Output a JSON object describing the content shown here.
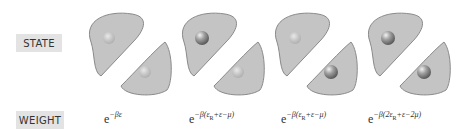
{
  "labels": {
    "state": "STATE",
    "weight": "WEIGHT"
  },
  "colors": {
    "cell_fill": "#c4c4c4",
    "cell_stroke": "#8a8a8a",
    "badge_bg": "#e3e3e3",
    "particle": "#8f8f8f"
  },
  "states": [
    {
      "top_site": "empty",
      "bottom_site": "empty",
      "weight_base": "e",
      "weight_exp": "−βε",
      "weight_exp_parts": [
        "−βε",
        "",
        ""
      ]
    },
    {
      "top_site": "occupied",
      "bottom_site": "empty",
      "weight_base": "e",
      "weight_exp_parts": [
        "−β(ε",
        "R",
        "+ε−μ)"
      ]
    },
    {
      "top_site": "empty",
      "bottom_site": "occupied",
      "weight_base": "e",
      "weight_exp_parts": [
        "−β(ε",
        "R",
        "+ε−μ)"
      ]
    },
    {
      "top_site": "occupied",
      "bottom_site": "occupied",
      "weight_base": "e",
      "weight_exp_parts": [
        "−β(2ε",
        "R",
        "+ε−2μ)"
      ]
    }
  ]
}
